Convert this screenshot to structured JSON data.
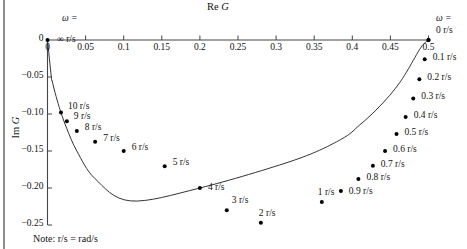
{
  "figure": {
    "note": "Note: r/s = rad/s"
  },
  "chart_data": {
    "type": "line",
    "title": "Re G",
    "subtitle": "",
    "xlabel": "Re G",
    "ylabel": "Im G",
    "xlim": [
      0,
      0.5
    ],
    "ylim": [
      -0.25,
      0
    ],
    "grid": false,
    "legend": "none",
    "x_ticks": [
      "0",
      "0.05",
      "0.1",
      "0.15",
      "0.2",
      "0.25",
      "0.3",
      "0.35",
      "0.4",
      "0.45",
      "0.5"
    ],
    "x_tick_values": [
      0,
      0.05,
      0.1,
      0.15,
      0.2,
      0.25,
      0.3,
      0.35,
      0.4,
      0.45,
      0.5
    ],
    "y_ticks": [
      "-0.05",
      "-0.10",
      "-0.15",
      "-0.20",
      "-0.25"
    ],
    "y_tick_values": [
      -0.05,
      -0.1,
      -0.15,
      -0.2,
      -0.25
    ],
    "annotations": {
      "omega_symbol_left": "ω =",
      "omega_value_left": "∞ r/s",
      "omega_symbol_right": "ω =",
      "omega_value_right": "0 r/s"
    },
    "series": [
      {
        "name": "G(jω)",
        "re": [
          0.0,
          0.005,
          0.0062,
          0.0077,
          0.0099,
          0.013,
          0.0177,
          0.0254,
          0.0385,
          0.0625,
          0.1087,
          0.2,
          0.3243,
          0.3846,
          0.4098,
          0.431,
          0.4487,
          0.463,
          0.4739,
          0.4902,
          0.5
        ],
        "im": [
          0.0,
          -0.0499,
          -0.0554,
          -0.0622,
          -0.0709,
          -0.0825,
          -0.0981,
          -0.1199,
          -0.15,
          -0.1875,
          -0.2174,
          -0.2,
          -0.1622,
          -0.1346,
          -0.1148,
          -0.0948,
          -0.0753,
          -0.0565,
          -0.0385,
          -0.0098,
          0.0
        ],
        "omega": [
          null,
          100,
          18,
          16,
          14,
          12,
          10,
          9,
          8,
          7,
          6,
          5,
          4,
          3,
          2,
          1.6,
          1.3,
          1.1,
          0.95,
          0.75,
          0.6
        ],
        "marker_points": [
          {
            "omega": 10,
            "label": "10 r/s",
            "re": 0.0177,
            "im": -0.0981
          },
          {
            "omega": 9,
            "label": "9 r/s",
            "re": 0.0254,
            "im": -0.1099
          },
          {
            "omega": 8,
            "label": "8 r/s",
            "re": 0.0385,
            "im": -0.1231
          },
          {
            "omega": 7,
            "label": "7 r/s",
            "re": 0.0625,
            "im": -0.1375
          },
          {
            "omega": 6,
            "label": "6 r/s",
            "re": 0.1,
            "im": -0.15
          },
          {
            "omega": 5,
            "label": "5 r/s",
            "re": 0.1538,
            "im": -0.1705
          },
          {
            "omega": 4,
            "label": "4 r/s",
            "re": 0.2,
            "im": -0.2
          },
          {
            "omega": 3,
            "label": "3 r/s",
            "re": 0.2353,
            "im": -0.23
          },
          {
            "omega": 2,
            "label": "2 r/s",
            "re": 0.28,
            "im": -0.247
          },
          {
            "omega": 1,
            "label": "1 r/s",
            "re": 0.36,
            "im": -0.219
          },
          {
            "omega": 0.9,
            "label": "0.9 r/s",
            "re": 0.385,
            "im": -0.204
          },
          {
            "omega": 0.8,
            "label": "0.8 r/s",
            "re": 0.408,
            "im": -0.188
          },
          {
            "omega": 0.7,
            "label": "0.7 r/s",
            "re": 0.427,
            "im": -0.17
          },
          {
            "omega": 0.6,
            "label": "0.6 r/s",
            "re": 0.443,
            "im": -0.15
          },
          {
            "omega": 0.5,
            "label": "0.5 r/s",
            "re": 0.458,
            "im": -0.127
          },
          {
            "omega": 0.4,
            "label": "0.4 r/s",
            "re": 0.47,
            "im": -0.104
          },
          {
            "omega": 0.3,
            "label": "0.3 r/s",
            "re": 0.48,
            "im": -0.079
          },
          {
            "omega": 0.2,
            "label": "0.2 r/s",
            "re": 0.488,
            "im": -0.053
          },
          {
            "omega": 0.1,
            "label": "0.1 r/s",
            "re": 0.495,
            "im": -0.026
          },
          {
            "omega": 0,
            "label": "0 r/s",
            "re": 0.5,
            "im": 0.0
          }
        ]
      }
    ]
  }
}
